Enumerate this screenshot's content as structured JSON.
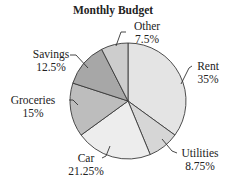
{
  "chart_data": {
    "type": "pie",
    "title": "Monthly Budget",
    "categories": [
      "Rent",
      "Utilities",
      "Car",
      "Groceries",
      "Savings",
      "Other"
    ],
    "values": [
      35,
      8.75,
      21.25,
      15,
      12.5,
      7.5
    ],
    "value_labels": [
      "35%",
      "8.75%",
      "21.25%",
      "15%",
      "12.5%",
      "7.5%"
    ],
    "unit": "%",
    "colors": [
      "#e4e4e4",
      "#d6d6d6",
      "#ededed",
      "#bdbdbd",
      "#a7a7a7",
      "#cdcdcd"
    ],
    "start_angle_deg": 0,
    "direction": "clockwise",
    "legend": "none (callout labels)"
  }
}
